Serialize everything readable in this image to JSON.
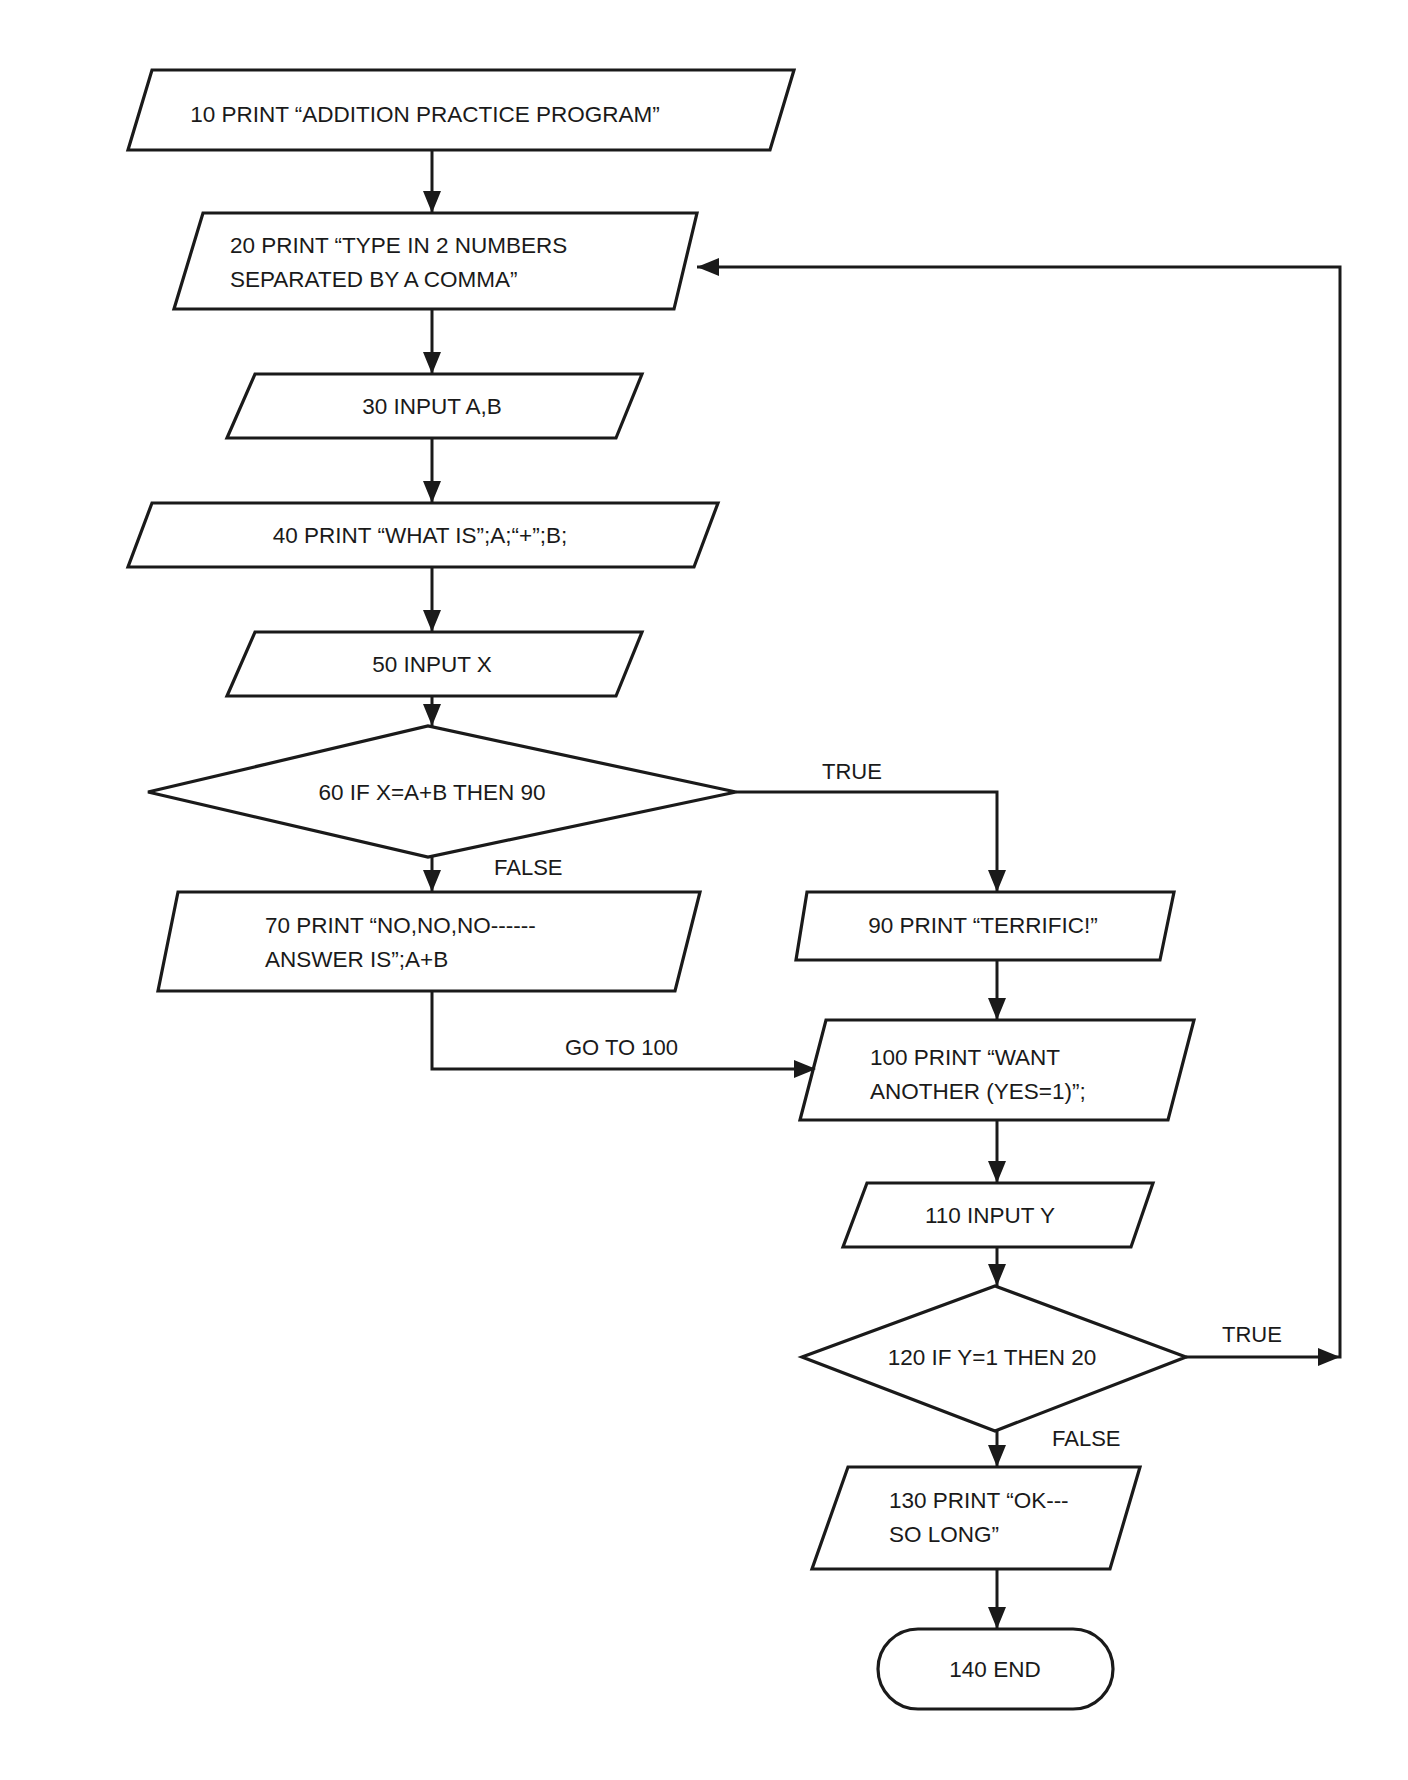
{
  "diagram": {
    "type": "flowchart",
    "stroke_color": "#1a1a1a",
    "nodes": [
      {
        "id": "n10",
        "shape": "parallelogram",
        "lines": [
          "10 PRINT “ADDITION PRACTICE PROGRAM”"
        ],
        "pts": "152,70 794,70 770,150 128,150",
        "tx": 425,
        "ty": 122,
        "anchor": "middle"
      },
      {
        "id": "n20",
        "shape": "parallelogram",
        "lines": [
          "20 PRINT “TYPE IN 2 NUMBERS",
          "SEPARATED BY A COMMA”"
        ],
        "pts": "203,213 697,213 674,309 174,309",
        "tx": 230,
        "ty": 253,
        "anchor": "start"
      },
      {
        "id": "n30",
        "shape": "parallelogram",
        "lines": [
          "30 INPUT A,B"
        ],
        "pts": "255,374 642,374 616,438 227,438",
        "tx": 432,
        "ty": 414,
        "anchor": "middle"
      },
      {
        "id": "n40",
        "shape": "parallelogram",
        "lines": [
          "40 PRINT “WHAT IS”;A;“+”;B;"
        ],
        "pts": "152,503 718,503 694,567 128,567",
        "tx": 420,
        "ty": 543,
        "anchor": "middle"
      },
      {
        "id": "n50",
        "shape": "parallelogram",
        "lines": [
          "50 INPUT X"
        ],
        "pts": "255,632 642,632 616,696 227,696",
        "tx": 432,
        "ty": 672,
        "anchor": "middle"
      },
      {
        "id": "n60",
        "shape": "diamond",
        "lines": [
          "60 IF X=A+B THEN 90"
        ],
        "pts": "148,792 428,726 736,792 428,857",
        "tx": 432,
        "ty": 800,
        "anchor": "middle"
      },
      {
        "id": "n70",
        "shape": "parallelogram",
        "lines": [
          "70 PRINT “NO,NO,NO------",
          "ANSWER IS”;A+B"
        ],
        "pts": "178,892 700,892 675,991 158,991",
        "tx": 265,
        "ty": 933,
        "anchor": "start"
      },
      {
        "id": "n90",
        "shape": "parallelogram",
        "lines": [
          "90 PRINT “TERRIFIC!”"
        ],
        "pts": "807,892 1174,892 1160,960 796,960",
        "tx": 983,
        "ty": 933,
        "anchor": "middle"
      },
      {
        "id": "n100",
        "shape": "parallelogram",
        "lines": [
          "100 PRINT “WANT",
          "ANOTHER (YES=1)”;"
        ],
        "pts": "826,1020 1194,1020 1168,1120 800,1120",
        "tx": 870,
        "ty": 1065,
        "anchor": "start"
      },
      {
        "id": "n110",
        "shape": "parallelogram",
        "lines": [
          "110 INPUT Y"
        ],
        "pts": "867,1183 1153,1183 1131,1247 843,1247",
        "tx": 990,
        "ty": 1223,
        "anchor": "middle"
      },
      {
        "id": "n120",
        "shape": "diamond",
        "lines": [
          "120 IF Y=1 THEN 20"
        ],
        "pts": "802,1357 995,1286 1186,1357 995,1431",
        "tx": 992,
        "ty": 1365,
        "anchor": "middle"
      },
      {
        "id": "n130",
        "shape": "parallelogram",
        "lines": [
          "130 PRINT “OK---",
          "SO LONG”"
        ],
        "pts": "848,1467 1140,1467 1110,1569 812,1569",
        "tx": 889,
        "ty": 1508,
        "anchor": "start"
      },
      {
        "id": "n140",
        "shape": "terminator",
        "lines": [
          "140 END"
        ],
        "x": 878,
        "y": 1629,
        "w": 235,
        "h": 80,
        "tx": 995,
        "ty": 1677,
        "anchor": "middle"
      }
    ],
    "edges": [
      {
        "from": "n10",
        "to": "n20",
        "points": "432,150 432,213",
        "label": ""
      },
      {
        "from": "n20",
        "to": "n30",
        "points": "432,309 432,374",
        "label": ""
      },
      {
        "from": "n30",
        "to": "n40",
        "points": "432,438 432,503",
        "label": ""
      },
      {
        "from": "n40",
        "to": "n50",
        "points": "432,567 432,632",
        "label": ""
      },
      {
        "from": "n50",
        "to": "n60",
        "points": "432,696 432,726",
        "label": ""
      },
      {
        "from": "n60",
        "to": "n70",
        "points": "432,857 432,892",
        "label": "FALSE"
      },
      {
        "from": "n60",
        "to": "n90",
        "points": "736,792 997,792 997,892",
        "label": "TRUE"
      },
      {
        "from": "n70",
        "to": "n100",
        "points": "432,991 432,1069 814,1069",
        "label": "GO TO 100"
      },
      {
        "from": "n90",
        "to": "n100",
        "points": "997,960 997,1020",
        "label": ""
      },
      {
        "from": "n100",
        "to": "n110",
        "points": "997,1120 997,1183",
        "label": ""
      },
      {
        "from": "n110",
        "to": "n120",
        "points": "997,1247 997,1286",
        "label": ""
      },
      {
        "from": "n120",
        "to": "n20",
        "points": "1186,1357 1340,1357 1340,267 697,267",
        "label": "TRUE"
      },
      {
        "from": "n120",
        "to": "n130",
        "points": "997,1431 997,1467",
        "label": "FALSE"
      },
      {
        "from": "n130",
        "to": "n140",
        "points": "997,1569 997,1629",
        "label": ""
      }
    ],
    "arrowheads": [
      {
        "dir": "down",
        "x": 432,
        "y": 213
      },
      {
        "dir": "down",
        "x": 432,
        "y": 374
      },
      {
        "dir": "down",
        "x": 432,
        "y": 503
      },
      {
        "dir": "down",
        "x": 432,
        "y": 632
      },
      {
        "dir": "down",
        "x": 432,
        "y": 726
      },
      {
        "dir": "down",
        "x": 432,
        "y": 892
      },
      {
        "dir": "down",
        "x": 997,
        "y": 892
      },
      {
        "dir": "right",
        "x": 816,
        "y": 1069
      },
      {
        "dir": "down",
        "x": 997,
        "y": 1020
      },
      {
        "dir": "down",
        "x": 997,
        "y": 1183
      },
      {
        "dir": "down",
        "x": 997,
        "y": 1286
      },
      {
        "dir": "right",
        "x": 1340,
        "y": 1357
      },
      {
        "dir": "left",
        "x": 697,
        "y": 267
      },
      {
        "dir": "down",
        "x": 997,
        "y": 1467
      },
      {
        "dir": "down",
        "x": 997,
        "y": 1629
      }
    ],
    "edge_labels": [
      {
        "text": "TRUE",
        "x": 822,
        "y": 779
      },
      {
        "text": "FALSE",
        "x": 494,
        "y": 875
      },
      {
        "text": "GO TO 100",
        "x": 565,
        "y": 1055
      },
      {
        "text": "TRUE",
        "x": 1222,
        "y": 1342
      },
      {
        "text": "FALSE",
        "x": 1052,
        "y": 1446
      }
    ]
  }
}
